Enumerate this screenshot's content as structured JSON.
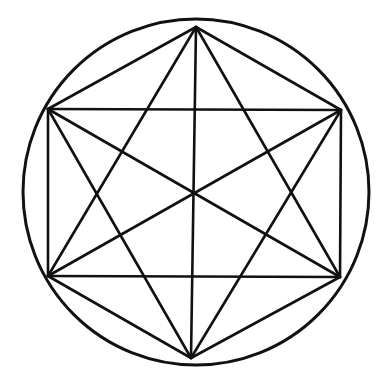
{
  "diagram": {
    "title": "",
    "background": "#ffffff",
    "stroke_color": "#111111",
    "circle": {
      "cx": 196,
      "cy": 192,
      "r": 173,
      "stroke_width": 3
    },
    "vertices": {
      "top": [
        196,
        27
      ],
      "upper_left": [
        48,
        109
      ],
      "upper_right": [
        341,
        110
      ],
      "lower_left": [
        48,
        276
      ],
      "lower_right": [
        340,
        277
      ],
      "bottom": [
        191,
        358
      ]
    },
    "lines": [
      {
        "name": "hexagon-edge-top-upper-right",
        "from": "top",
        "to": "upper_right"
      },
      {
        "name": "hexagon-edge-upper-right-lower-right",
        "from": "upper_right",
        "to": "lower_right"
      },
      {
        "name": "hexagon-edge-lower-right-bottom",
        "from": "lower_right",
        "to": "bottom"
      },
      {
        "name": "hexagon-edge-bottom-lower-left",
        "from": "bottom",
        "to": "lower_left"
      },
      {
        "name": "hexagon-edge-lower-left-upper-left",
        "from": "lower_left",
        "to": "upper_left"
      },
      {
        "name": "hexagon-edge-upper-left-top",
        "from": "upper_left",
        "to": "top"
      },
      {
        "name": "rectangle-top-edge",
        "from": "upper_left",
        "to": "upper_right"
      },
      {
        "name": "rectangle-bottom-edge",
        "from": "lower_left",
        "to": "lower_right"
      },
      {
        "name": "vertical-diameter",
        "from": "top",
        "to": "bottom"
      },
      {
        "name": "triangle-up-left-side",
        "from": "top",
        "to": "lower_left"
      },
      {
        "name": "triangle-up-right-side",
        "from": "top",
        "to": "lower_right"
      },
      {
        "name": "triangle-down-left-side",
        "from": "bottom",
        "to": "upper_left"
      },
      {
        "name": "triangle-down-right-side",
        "from": "bottom",
        "to": "upper_right"
      },
      {
        "name": "diagonal-upper-left-lower-right",
        "from": "upper_left",
        "to": "lower_right"
      },
      {
        "name": "diagonal-upper-right-lower-left",
        "from": "upper_right",
        "to": "lower_left"
      }
    ],
    "line_stroke_width": 2.6,
    "labels": []
  }
}
